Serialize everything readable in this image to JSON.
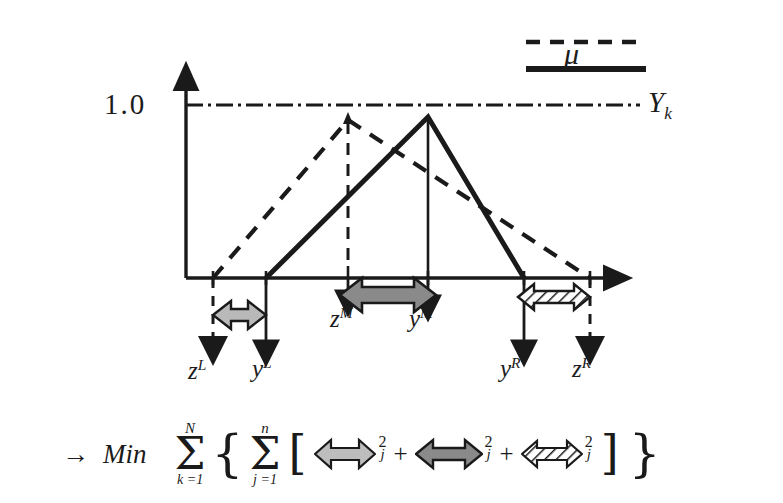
{
  "figure": {
    "title_axis_value": "1.0",
    "legend": {
      "dashed_name": "z-membership-dashed-line",
      "solid_name": "y-membership-solid-line",
      "mu_label": "μ"
    },
    "axis": {
      "y_axis_name": "mu-axis",
      "x_axis_name": "x-axis",
      "level_label": "1.0",
      "level_line_style": "dash-dot",
      "right_label_base": "Y",
      "right_label_sub": "k"
    },
    "points": [
      {
        "id": "zL",
        "base": "z",
        "sup": "L",
        "x": 213,
        "kind": "dashed-support-left"
      },
      {
        "id": "yL",
        "base": "y",
        "sup": "L",
        "x": 266,
        "kind": "solid-support-left"
      },
      {
        "id": "zM",
        "base": "z",
        "sup": "M",
        "x": 348,
        "kind": "dashed-peak"
      },
      {
        "id": "yM",
        "base": "y",
        "sup": "M",
        "x": 428,
        "kind": "solid-peak"
      },
      {
        "id": "yR",
        "base": "y",
        "sup": "R",
        "x": 524,
        "kind": "solid-support-right"
      },
      {
        "id": "zR",
        "base": "z",
        "sup": "R",
        "x": 590,
        "kind": "dashed-support-right"
      }
    ],
    "deviation_arrows": [
      {
        "id": "left-deviation",
        "fill": "light-gray",
        "from": "zL",
        "to": "yL"
      },
      {
        "id": "middle-deviation",
        "fill": "dark-gray",
        "from": "zM",
        "to": "yM"
      },
      {
        "id": "right-deviation",
        "fill": "hatched",
        "from": "yR",
        "to": "zR"
      }
    ],
    "colors": {
      "stroke": "#1a1a1a",
      "light_gray_fill": "#b3b3b3",
      "dark_gray_fill": "#808080",
      "hatch_fill": "#ffffff",
      "background": "#ffffff"
    }
  },
  "formula": {
    "arrow_glyph": "→",
    "min_label": "Min",
    "outer_sum": {
      "top": "N",
      "bottom": "k =1"
    },
    "inner_sum": {
      "top": "n",
      "bottom": "j =1"
    },
    "open_brace": "{",
    "close_brace": "}",
    "open_bracket": "[",
    "close_bracket": "]",
    "plus": "+",
    "exponent": "2",
    "index": "j",
    "terms": [
      {
        "id": "term-left",
        "fill": "light-gray"
      },
      {
        "id": "term-middle",
        "fill": "dark-gray"
      },
      {
        "id": "term-right",
        "fill": "hatched"
      }
    ]
  }
}
